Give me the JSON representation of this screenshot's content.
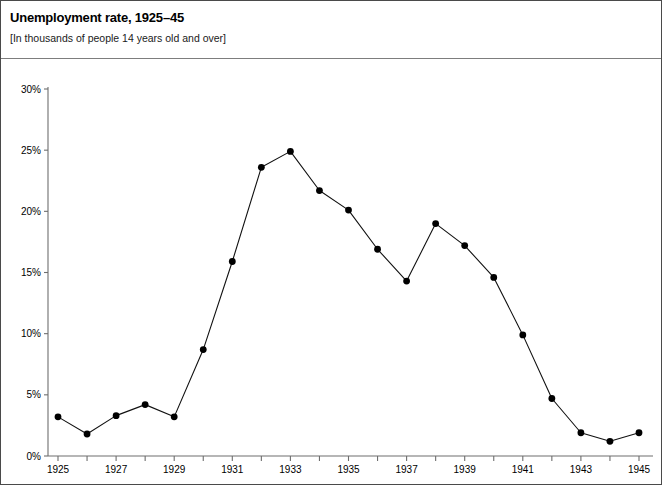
{
  "header": {
    "title": "Unemployment rate, 1925–45",
    "subtitle": "[In thousands of people 14 years old and over]"
  },
  "colors": {
    "line": "#111111",
    "marker": "#000000",
    "axis": "#6e6e6e",
    "border": "#4a4a4a",
    "background": "#ffffff",
    "text": "#000000"
  },
  "chart_data": {
    "type": "line",
    "title": "Unemployment rate, 1925–45",
    "subtitle": "[In thousands of people 14 years old and over]",
    "xlabel": "",
    "ylabel": "",
    "x": [
      1925,
      1926,
      1927,
      1928,
      1929,
      1930,
      1931,
      1932,
      1933,
      1934,
      1935,
      1936,
      1937,
      1938,
      1939,
      1940,
      1941,
      1942,
      1943,
      1944,
      1945
    ],
    "values": [
      3.2,
      1.8,
      3.3,
      4.2,
      3.2,
      8.7,
      15.9,
      23.6,
      24.9,
      21.7,
      20.1,
      16.9,
      14.3,
      19.0,
      17.2,
      14.6,
      9.9,
      4.7,
      1.9,
      1.2,
      1.9
    ],
    "series": [
      {
        "name": "Unemployment rate",
        "values": [
          3.2,
          1.8,
          3.3,
          4.2,
          3.2,
          8.7,
          15.9,
          23.6,
          24.9,
          21.7,
          20.1,
          16.9,
          14.3,
          19.0,
          17.2,
          14.6,
          9.9,
          4.7,
          1.9,
          1.2,
          1.9
        ]
      }
    ],
    "xlim": [
      1925,
      1945
    ],
    "ylim": [
      0,
      30
    ],
    "yticks": [
      0,
      5,
      10,
      15,
      20,
      25,
      30
    ],
    "ytick_labels": [
      "0%",
      "5%",
      "10%",
      "15%",
      "20%",
      "25%",
      "30%"
    ],
    "xticks": [
      1925,
      1926,
      1927,
      1928,
      1929,
      1930,
      1931,
      1932,
      1933,
      1934,
      1935,
      1936,
      1937,
      1938,
      1939,
      1940,
      1941,
      1942,
      1943,
      1944,
      1945
    ],
    "xtick_labels": [
      "1925",
      "",
      "1927",
      "",
      "1929",
      "",
      "1931",
      "",
      "1933",
      "",
      "1935",
      "",
      "1937",
      "",
      "1939",
      "",
      "1941",
      "",
      "1943",
      "",
      "1945"
    ],
    "grid": false,
    "legend": false,
    "markers": true,
    "marker_style": "filled-circle"
  }
}
